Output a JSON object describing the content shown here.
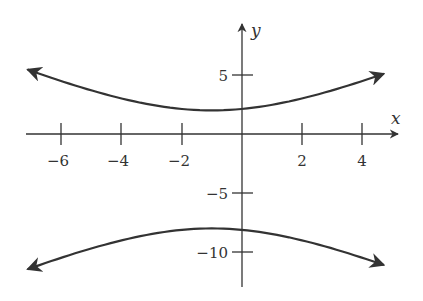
{
  "chart_data": {
    "type": "line",
    "title": "",
    "equation_estimate": "(y+3)^2/25 - (x+1)^2/20 = 1",
    "xlabel": "x",
    "ylabel": "y",
    "xlim": [
      -7.2,
      5.3
    ],
    "ylim": [
      -12.8,
      9.5
    ],
    "grid": false,
    "legend": null,
    "x_ticks": [
      -6,
      -4,
      -2,
      2,
      4
    ],
    "x_tick_labels": [
      "−6",
      "−4",
      "−2",
      "2",
      "4"
    ],
    "y_ticks": [
      5,
      -5,
      -10
    ],
    "y_tick_labels": [
      "5",
      "−5",
      "−10"
    ],
    "series": [
      {
        "name": "upper branch",
        "x": [
          -7.2,
          -6,
          -4,
          -2,
          -1,
          0,
          2,
          4,
          4.8
        ],
        "y": [
          5.0,
          4.4,
          3.0,
          2.1,
          2.0,
          2.1,
          3.0,
          4.4,
          5.0
        ],
        "arrows_both_ends": true
      },
      {
        "name": "lower branch",
        "x": [
          -7.2,
          -6,
          -4,
          -2,
          -1,
          0,
          2,
          4,
          4.8
        ],
        "y": [
          -11.0,
          -10.4,
          -9.0,
          -8.1,
          -8.0,
          -8.1,
          -9.0,
          -10.4,
          -11.0
        ],
        "arrows_both_ends": true
      }
    ],
    "colors": {
      "curve": "#333333",
      "axis": "#333333"
    }
  }
}
